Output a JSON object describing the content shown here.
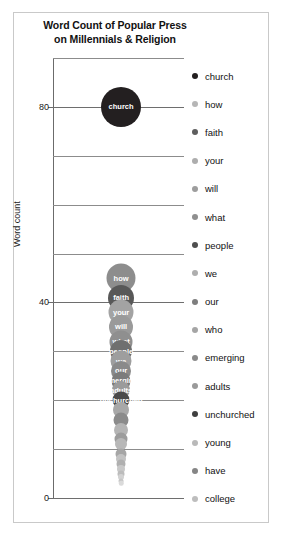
{
  "chart_data": {
    "type": "scatter",
    "title": "Word Count of Popular Press on Millennials & Religion",
    "title_line1": "Word Count of Popular Press",
    "title_line2": "on Millennials & Religion",
    "xlabel": "",
    "ylabel": "Word count",
    "ylim": [
      0,
      90
    ],
    "grid": true,
    "grid_step": 10,
    "legend_position": "right",
    "ytick_labels": [
      "80",
      "40",
      "0"
    ],
    "ytick_values": [
      80,
      40,
      0
    ],
    "gridline_values": [
      90,
      80,
      70,
      60,
      50,
      40,
      30,
      20,
      10,
      0
    ],
    "categories": [
      "church",
      "how",
      "faith",
      "your",
      "will",
      "what",
      "people",
      "we",
      "our",
      "emerging",
      "adults",
      "unchurched",
      "young",
      "have",
      "college"
    ],
    "series": [
      {
        "name": "word counts",
        "points": [
          {
            "label": "church",
            "value": 80,
            "x": 0.52,
            "size": 40,
            "color": "#231f20",
            "label_visible": true
          },
          {
            "label": "how",
            "value": 45,
            "x": 0.52,
            "size": 29,
            "color": "#8d8d8d",
            "label_visible": true
          },
          {
            "label": "faith",
            "value": 41,
            "x": 0.52,
            "size": 26,
            "color": "#585858",
            "label_visible": true
          },
          {
            "label": "your",
            "value": 38,
            "x": 0.52,
            "size": 25,
            "color": "#a3a3a3",
            "label_visible": true
          },
          {
            "label": "will",
            "value": 35,
            "x": 0.52,
            "size": 24,
            "color": "#9a9a9a",
            "label_visible": true
          },
          {
            "label": "what",
            "value": 32,
            "x": 0.52,
            "size": 23,
            "color": "#8f8f8f",
            "label_visible": true
          },
          {
            "label": "people",
            "value": 30,
            "x": 0.52,
            "size": 22,
            "color": "#6f6f6f",
            "label_visible": true
          },
          {
            "label": "we",
            "value": 28,
            "x": 0.52,
            "size": 21,
            "color": "#9e9e9e",
            "label_visible": true
          },
          {
            "label": "our",
            "value": 26,
            "x": 0.52,
            "size": 20,
            "color": "#8a8a8a",
            "label_visible": true
          },
          {
            "label": "emerging",
            "value": 24,
            "x": 0.52,
            "size": 19,
            "color": "#7c7c7c",
            "label_visible": true
          },
          {
            "label": "adults",
            "value": 22,
            "x": 0.52,
            "size": 18,
            "color": "#9b9b9b",
            "label_visible": true
          },
          {
            "label": "unchurched",
            "value": 20,
            "x": 0.52,
            "size": 17,
            "color": "#4a4a4a",
            "label_visible": true
          },
          {
            "label": "young",
            "value": 18,
            "x": 0.52,
            "size": 16,
            "color": "#a8a8a8",
            "label_visible": false
          },
          {
            "label": "have",
            "value": 16,
            "x": 0.52,
            "size": 15,
            "color": "#8b8b8b",
            "label_visible": false
          },
          {
            "label": "college",
            "value": 14,
            "x": 0.52,
            "size": 14,
            "color": "#b4b4b4",
            "label_visible": false
          },
          {
            "label": "",
            "value": 12,
            "x": 0.52,
            "size": 13,
            "color": "#9c9c9c",
            "label_visible": false
          },
          {
            "label": "",
            "value": 11,
            "x": 0.52,
            "size": 12,
            "color": "#b8b8b8",
            "label_visible": false
          },
          {
            "label": "",
            "value": 9,
            "x": 0.52,
            "size": 11,
            "color": "#a6a6a6",
            "label_visible": false
          },
          {
            "label": "",
            "value": 8,
            "x": 0.52,
            "size": 10,
            "color": "#c2c2c2",
            "label_visible": false
          },
          {
            "label": "",
            "value": 7,
            "x": 0.52,
            "size": 9,
            "color": "#b0b0b0",
            "label_visible": false
          },
          {
            "label": "",
            "value": 6,
            "x": 0.52,
            "size": 8,
            "color": "#c8c8c8",
            "label_visible": false
          },
          {
            "label": "",
            "value": 5,
            "x": 0.52,
            "size": 7,
            "color": "#bcbcbc",
            "label_visible": false
          },
          {
            "label": "",
            "value": 4.2,
            "x": 0.52,
            "size": 6,
            "color": "#d2d2d2",
            "label_visible": false
          },
          {
            "label": "",
            "value": 3.5,
            "x": 0.52,
            "size": 5,
            "color": "#c6c6c6",
            "label_visible": false
          },
          {
            "label": "",
            "value": 3,
            "x": 0.52,
            "size": 4.5,
            "color": "#dadada",
            "label_visible": false
          }
        ]
      }
    ]
  },
  "legend": {
    "items": [
      {
        "label": "church",
        "color": "#231f20"
      },
      {
        "label": "how",
        "color": "#b6b6b6"
      },
      {
        "label": "faith",
        "color": "#5e5e5e"
      },
      {
        "label": "your",
        "color": "#adadad"
      },
      {
        "label": "will",
        "color": "#9d9d9d"
      },
      {
        "label": "what",
        "color": "#8f8f8f"
      },
      {
        "label": "people",
        "color": "#4e4e4e"
      },
      {
        "label": "we",
        "color": "#aeaeae"
      },
      {
        "label": "our",
        "color": "#7e7e7e"
      },
      {
        "label": "who",
        "color": "#a5a5a5"
      },
      {
        "label": "emerging",
        "color": "#8a8a8a"
      },
      {
        "label": "adults",
        "color": "#9a9a9a"
      },
      {
        "label": "unchurched",
        "color": "#3f3f3f"
      },
      {
        "label": "young",
        "color": "#b9b9b9"
      },
      {
        "label": "have",
        "color": "#858585"
      },
      {
        "label": "college",
        "color": "#bdbdbd"
      }
    ]
  }
}
